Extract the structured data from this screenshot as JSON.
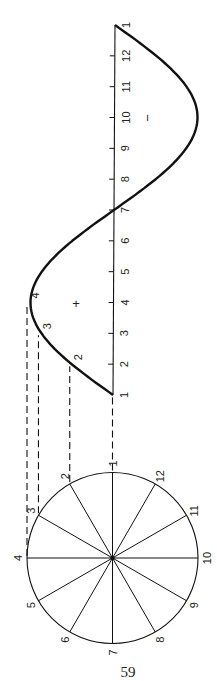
{
  "figure": {
    "circle": {
      "point_labels": [
        "1",
        "2",
        "3",
        "4",
        "5",
        "6",
        "7",
        "8",
        "9",
        "10",
        "11",
        "12"
      ]
    },
    "wave": {
      "axis_labels": [
        "1",
        "2",
        "3",
        "4",
        "5",
        "6",
        "7",
        "8",
        "9",
        "10",
        "11",
        "12",
        "1"
      ],
      "curve_point_labels": [
        "2",
        "3",
        "4"
      ],
      "positive_sign": "+",
      "negative_sign": "−"
    },
    "projection_lines": [
      "1",
      "2",
      "3",
      "4"
    ],
    "page_number": "59",
    "colors": {
      "ink": "#111111",
      "background": "#ffffff"
    }
  }
}
